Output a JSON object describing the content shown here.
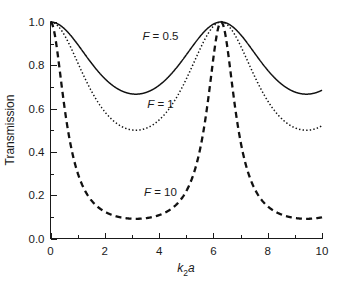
{
  "chart_data": {
    "type": "line",
    "title": "",
    "xlabel": "k2a",
    "xlabel_parts": {
      "base1": "k",
      "sub": "2",
      "base2": "a"
    },
    "ylabel": "Transmission",
    "xlim": [
      0,
      10
    ],
    "ylim": [
      0.0,
      1.0
    ],
    "grid": false,
    "legend_position": "inline-annotations",
    "x_ticks_major": [
      0,
      2,
      4,
      6,
      8,
      10
    ],
    "x_tick_labels": [
      "0",
      "2",
      "4",
      "6",
      "8",
      "10"
    ],
    "x_ticks_minor": [
      1,
      3,
      5,
      7,
      9
    ],
    "y_ticks_major": [
      0.0,
      0.2,
      0.4,
      0.6,
      0.8,
      1.0
    ],
    "y_tick_labels": [
      "0.0",
      "0.2",
      "0.4",
      "0.6",
      "0.8",
      "1.0"
    ],
    "y_ticks_minor": [
      0.1,
      0.3,
      0.5,
      0.7,
      0.9
    ],
    "formula": "T = 1 / (1 + F*sin^2(k2a/2))",
    "peak_positions": [
      0,
      3.1416,
      6.2832,
      9.4248
    ],
    "peak_value": 1.0,
    "trough_positions": [
      1.5708,
      4.7124,
      7.854
    ],
    "series": [
      {
        "name": "F = 0.5",
        "F": 0.5,
        "style": "solid",
        "stroke_width": 1.5,
        "color": "#111111",
        "annotation": {
          "label": "F = 0.5",
          "italic_prefix": "F",
          "rest": " = 0.5",
          "x": 4.05,
          "y": 0.935
        },
        "minimum": 0.6667,
        "trough_value": 0.8,
        "x": [
          0,
          0.25,
          0.5,
          0.75,
          1,
          1.25,
          1.5708,
          2,
          2.5,
          3.1416,
          3.75,
          4.25,
          4.7124,
          5.25,
          5.75,
          6.2832,
          6.9,
          7.4,
          7.854,
          8.4,
          9,
          9.4248,
          10
        ],
        "values": [
          1.0,
          0.9923,
          0.9699,
          0.9355,
          0.8934,
          0.8501,
          0.8,
          0.8318,
          0.9105,
          1.0,
          0.9216,
          0.8337,
          0.8,
          0.844,
          0.9193,
          1.0,
          0.9406,
          0.8444,
          0.8,
          0.8327,
          0.9289,
          1.0,
          0.925
        ]
      },
      {
        "name": "F = 1",
        "F": 1,
        "style": "dotted",
        "stroke_width": 1.5,
        "color": "#111111",
        "annotation": {
          "label": "F = 1",
          "italic_prefix": "F",
          "rest": " = 1",
          "x": 4.05,
          "y": 0.62
        },
        "minimum": 0.5,
        "trough_value": 0.5,
        "x": [
          0,
          0.25,
          0.5,
          0.75,
          1,
          1.25,
          1.5708,
          2,
          2.5,
          3.1416,
          3.75,
          4.25,
          4.7124,
          5.25,
          5.75,
          6.2832,
          6.9,
          7.4,
          7.854,
          8.4,
          9,
          9.4248,
          10
        ],
        "values": [
          1.0,
          0.9846,
          0.9416,
          0.8794,
          0.8081,
          0.7392,
          0.5,
          0.7083,
          0.8357,
          1.0,
          0.8546,
          0.7148,
          0.5,
          0.7303,
          0.8506,
          1.0,
          0.888,
          0.7306,
          0.5,
          0.7134,
          0.8672,
          1.0,
          0.86
        ]
      },
      {
        "name": "F = 10",
        "F": 10,
        "style": "dashed",
        "stroke_width": 2.3,
        "color": "#111111",
        "annotation": {
          "label": "F = 10",
          "italic_prefix": "F",
          "rest": " = 10",
          "x": 4.05,
          "y": 0.215
        },
        "minimum": 0.0909,
        "trough_value": 0.0909,
        "x": [
          0,
          0.25,
          0.5,
          0.75,
          1,
          1.25,
          1.5708,
          2,
          2.5,
          3.1416,
          3.75,
          4.25,
          4.7124,
          5.25,
          5.75,
          6.2832,
          6.9,
          7.4,
          7.854,
          8.4,
          9,
          9.4248,
          10
        ],
        "values": [
          1.0,
          0.8656,
          0.6192,
          0.4168,
          0.2853,
          0.2047,
          0.0909,
          0.1754,
          0.3489,
          1.0,
          0.3934,
          0.185,
          0.0909,
          0.2015,
          0.3851,
          1.0,
          0.4841,
          0.2027,
          0.0909,
          0.1775,
          0.4272,
          1.0,
          0.386
        ]
      }
    ]
  }
}
